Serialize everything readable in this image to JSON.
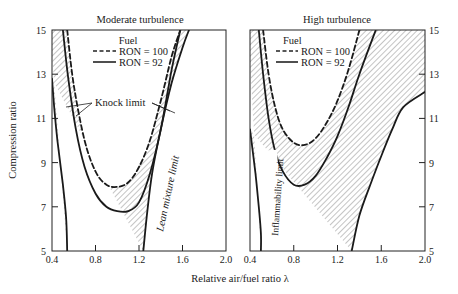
{
  "chart_data": [
    {
      "type": "line",
      "title": "Moderate turbulence",
      "xlabel": "Relative air/fuel ratio λ",
      "ylabel": "Compression ratio",
      "xlim": [
        0.4,
        2.0
      ],
      "ylim": [
        5,
        15
      ],
      "xticks": [
        "0.4",
        "0.8",
        "1.2",
        "1.6",
        "2.0"
      ],
      "yticks": [
        "5",
        "7",
        "9",
        "11",
        "13",
        "15"
      ],
      "legend": {
        "title": "Fuel",
        "entries": [
          "RON = 100",
          "RON = 92"
        ],
        "position": "top-left inside"
      },
      "annotations": [
        "Knock limit",
        "Lean mixture limit"
      ],
      "series": [
        {
          "name": "RON = 100 knock limit",
          "style": "dashed",
          "points": [
            [
              0.54,
              15
            ],
            [
              0.6,
              12.5
            ],
            [
              0.7,
              10
            ],
            [
              0.8,
              8.6
            ],
            [
              0.9,
              8.0
            ],
            [
              1.0,
              7.9
            ],
            [
              1.1,
              8.1
            ],
            [
              1.2,
              8.8
            ],
            [
              1.3,
              10.0
            ],
            [
              1.4,
              11.8
            ],
            [
              1.5,
              13.8
            ],
            [
              1.58,
              15
            ]
          ]
        },
        {
          "name": "RON = 92 knock limit",
          "style": "solid",
          "points": [
            [
              0.5,
              15
            ],
            [
              0.55,
              12.8
            ],
            [
              0.62,
              10.5
            ],
            [
              0.7,
              8.8
            ],
            [
              0.8,
              7.6
            ],
            [
              0.9,
              7.0
            ],
            [
              1.0,
              6.8
            ],
            [
              1.1,
              6.8
            ],
            [
              1.2,
              7.2
            ],
            [
              1.3,
              8.5
            ],
            [
              1.4,
              10.5
            ],
            [
              1.5,
              13.2
            ],
            [
              1.58,
              15
            ]
          ]
        },
        {
          "name": "Rich limit",
          "style": "solid",
          "points": [
            [
              0.4,
              12.8
            ],
            [
              0.42,
              11.5
            ],
            [
              0.45,
              10
            ],
            [
              0.5,
              8
            ],
            [
              0.53,
              6.5
            ],
            [
              0.54,
              5
            ]
          ]
        },
        {
          "name": "Lean mixture limit",
          "style": "solid",
          "points": [
            [
              1.24,
              5
            ],
            [
              1.27,
              6.5
            ],
            [
              1.32,
              8.5
            ],
            [
              1.4,
              10.5
            ],
            [
              1.5,
              12.6
            ],
            [
              1.6,
              14.2
            ],
            [
              1.66,
              15
            ]
          ]
        }
      ]
    },
    {
      "type": "line",
      "title": "High turbulence",
      "xlabel": "Relative air/fuel ratio λ",
      "ylabel": "Compression ratio",
      "xlim": [
        0.4,
        2.0
      ],
      "ylim": [
        5,
        15
      ],
      "xticks": [
        "0.4",
        "0.8",
        "1.2",
        "1.6",
        "2.0"
      ],
      "yticks": [
        "5",
        "7",
        "9",
        "11",
        "13",
        "15"
      ],
      "legend": {
        "title": "Fuel",
        "entries": [
          "RON = 100",
          "RON = 92"
        ],
        "position": "top-left inside"
      },
      "annotations": [
        "Inflammability limit"
      ],
      "series": [
        {
          "name": "RON = 100 knock limit",
          "style": "dashed",
          "points": [
            [
              0.52,
              15
            ],
            [
              0.57,
              13
            ],
            [
              0.63,
              11.5
            ],
            [
              0.7,
              10.5
            ],
            [
              0.8,
              9.9
            ],
            [
              0.9,
              9.8
            ],
            [
              1.0,
              10.1
            ],
            [
              1.1,
              10.8
            ],
            [
              1.2,
              11.8
            ],
            [
              1.3,
              13.2
            ],
            [
              1.4,
              15
            ]
          ]
        },
        {
          "name": "RON = 92 knock limit",
          "style": "solid",
          "points": [
            [
              0.48,
              15
            ],
            [
              0.52,
              13
            ],
            [
              0.57,
              11
            ],
            [
              0.63,
              9.5
            ],
            [
              0.7,
              8.6
            ],
            [
              0.8,
              8.0
            ],
            [
              0.9,
              8.0
            ],
            [
              1.0,
              8.4
            ],
            [
              1.1,
              9.2
            ],
            [
              1.2,
              10.2
            ],
            [
              1.3,
              11.5
            ],
            [
              1.4,
              13
            ],
            [
              1.55,
              15
            ]
          ]
        },
        {
          "name": "Inflammability limit",
          "style": "solid",
          "points": [
            [
              0.4,
              10.5
            ],
            [
              0.45,
              8.5
            ],
            [
              0.48,
              7
            ],
            [
              0.5,
              5.8
            ],
            [
              0.5,
              5
            ]
          ]
        },
        {
          "name": "Lean limit",
          "style": "solid",
          "points": [
            [
              1.33,
              5
            ],
            [
              1.4,
              6.6
            ],
            [
              1.5,
              8.0
            ],
            [
              1.6,
              9.3
            ],
            [
              1.7,
              10.5
            ],
            [
              1.8,
              11.5
            ],
            [
              2.0,
              12.2
            ]
          ]
        }
      ]
    }
  ],
  "labels": {
    "panel_left_title": "Moderate turbulence",
    "panel_right_title": "High turbulence",
    "legend_title": "Fuel",
    "legend_ron100": "RON = 100",
    "legend_ron92": "RON = 92",
    "knock_limit": "Knock limit",
    "lean_mixture_limit": "Lean mixture limit",
    "inflammability_limit": "Inflammability limit",
    "ylabel": "Compression ratio",
    "xlabel": "Relative air/fuel ratio λ",
    "xticks": [
      "0.4",
      "0.8",
      "1.2",
      "1.6",
      "2.0"
    ],
    "yticks": [
      "15",
      "13",
      "11",
      "9",
      "7",
      "5"
    ]
  }
}
